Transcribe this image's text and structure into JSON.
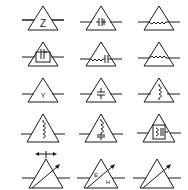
{
  "diagram": {
    "type": "symbol-grid",
    "rows": 5,
    "columns": 3,
    "stroke_color": "#1a1a1a",
    "background": "#ffffff",
    "symbols": [
      {
        "row": 0,
        "col": 0,
        "name": "impedance-network",
        "label": "Z"
      },
      {
        "row": 0,
        "col": 1,
        "name": "capacitor-network",
        "label": ""
      },
      {
        "row": 0,
        "col": 2,
        "name": "resistor-network",
        "label": ""
      },
      {
        "row": 1,
        "col": 0,
        "name": "capacitor-box-network",
        "label": ""
      },
      {
        "row": 1,
        "col": 1,
        "name": "resistor-capacitor-network",
        "label": ""
      },
      {
        "row": 1,
        "col": 2,
        "name": "resistor-network-2",
        "label": ""
      },
      {
        "row": 2,
        "col": 0,
        "name": "admittance-network",
        "label": "Y"
      },
      {
        "row": 2,
        "col": 1,
        "name": "shunt-capacitor-network",
        "label": ""
      },
      {
        "row": 2,
        "col": 2,
        "name": "shunt-inductor-network",
        "label": ""
      },
      {
        "row": 3,
        "col": 0,
        "name": "inductor-network",
        "label": ""
      },
      {
        "row": 3,
        "col": 1,
        "name": "inductor-capacitor-network",
        "label": ""
      },
      {
        "row": 3,
        "col": 2,
        "name": "resonator-box-network",
        "label": ""
      },
      {
        "row": 4,
        "col": 0,
        "name": "adjustable-network-with-width-arrow",
        "label": ""
      },
      {
        "row": 4,
        "col": 1,
        "name": "adjustable-network-eh",
        "label_e": "E",
        "label_h": "H"
      },
      {
        "row": 4,
        "col": 2,
        "name": "adjustable-network",
        "label": ""
      }
    ]
  }
}
